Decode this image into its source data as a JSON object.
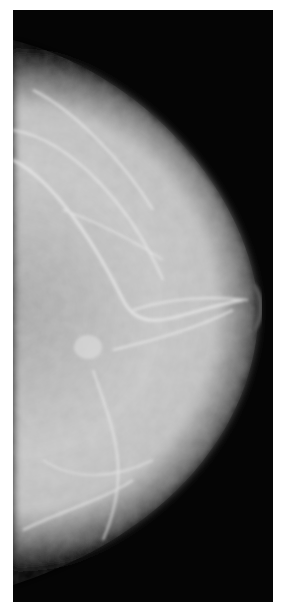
{
  "image": {
    "description": "Mammogram (mediolateral view) showing breast tissue with fibroglandular structures against a dark background",
    "colors": {
      "background": "#050505",
      "tissue_light": "#e6e6e6",
      "tissue_mid": "#a8a8a8",
      "page": "#ffffff"
    }
  }
}
